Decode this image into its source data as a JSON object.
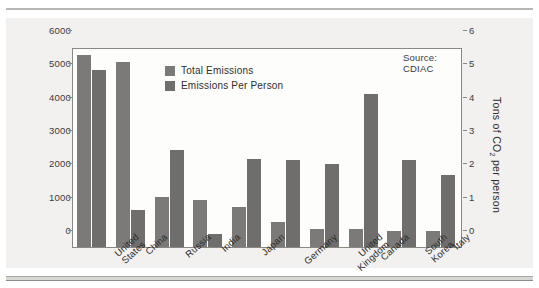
{
  "source_note": "Source: CDIAC",
  "legend": [
    {
      "label": "Total Emissions",
      "color": "#7b7a78"
    },
    {
      "label": "Emissions Per Person",
      "color": "#6f6e6c"
    }
  ],
  "axes": {
    "left_title_pre": "Million tons of CO",
    "left_title_sub": "2",
    "right_title_pre": "Tons of CO",
    "right_title_sub": "2",
    "right_title_post": " per person",
    "left_ticks": [
      "6000",
      "5000",
      "4000",
      "3000",
      "2000",
      "1000",
      "0"
    ],
    "right_ticks": [
      "6",
      "5",
      "4",
      "3",
      "2",
      "1",
      "0"
    ]
  },
  "chart_data": {
    "type": "bar",
    "title": "",
    "xlabel": "",
    "ylabel": "Million tons of CO2",
    "y2label": "Tons of CO2 per person",
    "ylim": [
      0,
      6000
    ],
    "y2lim": [
      0,
      6
    ],
    "grid": false,
    "legend_position": "inside-top-left",
    "annotations": [
      "Source: CDIAC"
    ],
    "categories": [
      "United States",
      "China",
      "Russia",
      "India",
      "Japan",
      "Germany",
      "United Kingdom",
      "Canada",
      "South Korea",
      "Italy"
    ],
    "category_lines": [
      [
        "United",
        "States"
      ],
      [
        "China"
      ],
      [
        "Russia"
      ],
      [
        "India"
      ],
      [
        "Japan"
      ],
      [
        "Germany"
      ],
      [
        "United",
        "Kingdom"
      ],
      [
        "Canada"
      ],
      [
        "South",
        "Korea"
      ],
      [
        "Italy"
      ]
    ],
    "series": [
      {
        "name": "Total Emissions",
        "axis": "left",
        "unit": "Million tons of CO2",
        "values": [
          5760,
          5550,
          1500,
          1400,
          1200,
          750,
          550,
          550,
          470,
          470
        ]
      },
      {
        "name": "Emissions Per Person",
        "axis": "right",
        "unit": "Tons of CO2 per person",
        "values": [
          5.3,
          1.1,
          2.9,
          0.4,
          2.65,
          2.6,
          2.5,
          4.6,
          2.6,
          2.15
        ]
      }
    ]
  }
}
